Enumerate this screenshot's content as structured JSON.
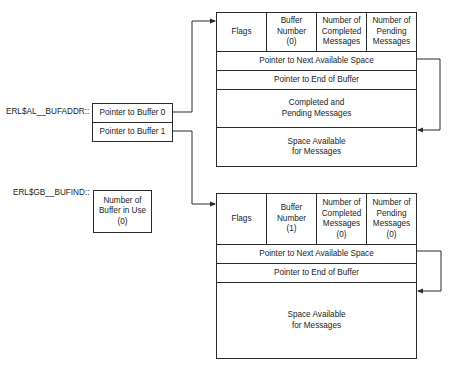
{
  "labels": {
    "bufaddr": "ERL$AL__BUFADDR::",
    "bufind": "ERL$GB__BUFIND::"
  },
  "pointer_table": {
    "rows": [
      "Pointer to Buffer 0",
      "Pointer to Buffer 1"
    ]
  },
  "buffer_in_use": {
    "text": "Number of\nBuffer in Use\n(0)"
  },
  "buffer0": {
    "header": [
      "Flags",
      "Buffer\nNumber\n(0)",
      "Number of\nCompleted\nMessages",
      "Number of\nPending\nMessages"
    ],
    "next_space": "Pointer to Next Available Space",
    "end_of_buffer": "Pointer to End of Buffer",
    "completed_pending": "Completed and\nPending Messages",
    "space_available": "Space Available\nfor Messages"
  },
  "buffer1": {
    "header": [
      "Flags",
      "Buffer\nNumber\n(1)",
      "Number of\nCompleted\nMessages\n(0)",
      "Number of\nPending\nMessages\n(0)"
    ],
    "next_space": "Pointer to Next Available Space",
    "end_of_buffer": "Pointer to End of Buffer",
    "space_available": "Space Available\nfor Messages"
  },
  "colors": {
    "line": "#2a2a2a",
    "text": "#1c1c1c",
    "background": "#ffffff"
  }
}
